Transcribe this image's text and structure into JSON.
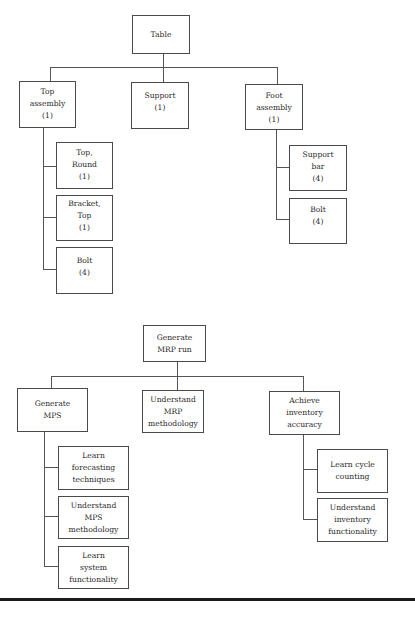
{
  "diagrams": [
    {
      "title": "Bill of materials - Table",
      "root": {
        "lines": [
          "Table"
        ]
      },
      "children": [
        {
          "lines": [
            "Top",
            "assembly",
            "(1)"
          ],
          "children": [
            {
              "lines": [
                "Top,",
                "Round",
                "(1)"
              ]
            },
            {
              "lines": [
                "Bracket,",
                "Top",
                "(1)"
              ]
            },
            {
              "lines": [
                "Bolt",
                "(4)"
              ]
            }
          ]
        },
        {
          "lines": [
            "Support",
            "(1)"
          ]
        },
        {
          "lines": [
            "Foot",
            "assembly",
            "(1)"
          ],
          "children": [
            {
              "lines": [
                "Support",
                "bar",
                "(4)"
              ]
            },
            {
              "lines": [
                "Bolt",
                "(4)"
              ]
            }
          ]
        }
      ]
    },
    {
      "title": "Work breakdown - Generate MRP run",
      "root": {
        "lines": [
          "Generate",
          "MRP run"
        ]
      },
      "children": [
        {
          "lines": [
            "Generate",
            "MPS"
          ],
          "children": [
            {
              "lines": [
                "Learn",
                "forecasting",
                "techniques"
              ]
            },
            {
              "lines": [
                "Understand",
                "MPS",
                "methodology"
              ]
            },
            {
              "lines": [
                "Learn",
                "system",
                "functionality"
              ]
            }
          ]
        },
        {
          "lines": [
            "Understand",
            "MRP",
            "methodology"
          ]
        },
        {
          "lines": [
            "Achieve",
            "inventory",
            "accuracy"
          ],
          "children": [
            {
              "lines": [
                "Learn cycle",
                "counting"
              ]
            },
            {
              "lines": [
                "Understand",
                "inventory",
                "functionality"
              ]
            }
          ]
        }
      ]
    }
  ],
  "colors": {
    "line": "#555555",
    "box_border": "#4a4a4a",
    "text": "#2a2a2a",
    "rule": "#1a1a1a"
  }
}
